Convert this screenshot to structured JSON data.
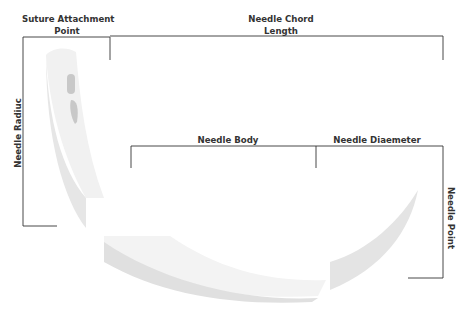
{
  "diagram": {
    "labels": {
      "suture_attachment_line1": "Suture Attachment",
      "suture_attachment_line2": "Point",
      "chord_length_line1": "Needle Chord",
      "chord_length_line2": "Length",
      "needle_radius": "Needle Radiuc",
      "needle_body": "Needle Body",
      "needle_diameter": "Needle Diaemeter",
      "needle_point": "Needle Point"
    },
    "colors": {
      "line": "#333333",
      "needle_light": "#f1f1f1",
      "needle_shade": "#e2e2e2",
      "swage_hole": "#c8c8c8"
    }
  }
}
